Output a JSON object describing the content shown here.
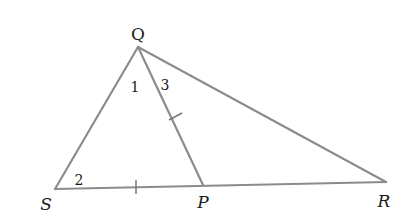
{
  "diagram": {
    "type": "triangle",
    "colors": {
      "background": "#ffffff",
      "line": "#8c8c8c",
      "text": "#1a1a1a"
    },
    "vertices": {
      "Q": {
        "label": "Q",
        "x": 138,
        "y": 47,
        "lx": 138,
        "ly": 40
      },
      "S": {
        "label": "S",
        "x": 55,
        "y": 189,
        "lx": 46,
        "ly": 210
      },
      "P": {
        "label": "P",
        "x": 203,
        "y": 185,
        "lx": 203,
        "ly": 208
      },
      "R": {
        "label": "R",
        "x": 386,
        "y": 182,
        "lx": 384,
        "ly": 207
      }
    },
    "segments": [
      {
        "from": "Q",
        "to": "S"
      },
      {
        "from": "Q",
        "to": "R"
      },
      {
        "from": "Q",
        "to": "P"
      },
      {
        "from": "S",
        "to": "R"
      }
    ],
    "angle_labels": [
      {
        "label": "1",
        "at": "Q",
        "between": "QS-QP",
        "x": 135,
        "y": 92
      },
      {
        "label": "3",
        "at": "Q",
        "between": "QP-QR",
        "x": 165,
        "y": 90
      },
      {
        "label": "2",
        "at": "S",
        "between": "SQ-SP",
        "x": 79,
        "y": 185
      }
    ],
    "congruence_marks": [
      {
        "segment": "QP",
        "ticks": 1
      },
      {
        "segment": "SP",
        "ticks": 1
      }
    ]
  }
}
